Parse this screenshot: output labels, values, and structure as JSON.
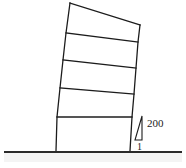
{
  "figure": {
    "background_color": "#ffffff",
    "line_color": "#1c1c1c",
    "ground_color": "#2b2b2b",
    "ground_shade_color": "#f4f4f4"
  },
  "building": {
    "name": "leaning-frame",
    "storeys": 5,
    "fill_color": "#ffffff",
    "outline": "70,3 140,25 130,151 56,151",
    "left_column_path": "M 70 3 L 66 33 L 63 60 L 60 88 L 57 117 L 56 151",
    "right_column_path": "M 140 25 L 138 42 L 136 68 L 134 94 L 132 117 L 130 151",
    "roof_line": "M 70 3 L 140 25",
    "base_line": "M 56 151 L 130 151",
    "floor_lines": [
      {
        "label": "floor-line-4",
        "d": "M 66 33 L 138 42"
      },
      {
        "label": "floor-line-3",
        "d": "M 63 60 L 136 68"
      },
      {
        "label": "floor-line-2",
        "d": "M 60 88 L 134 94"
      },
      {
        "label": "floor-line-1",
        "d": "M 57 117 L 132 117"
      }
    ]
  },
  "ground": {
    "name": "ground-line",
    "d": "M 4 152 L 182 152",
    "shade_rect": {
      "x": 4,
      "y": 153,
      "width": 178,
      "height": 9
    }
  },
  "slope_indicator": {
    "name": "slope-triangle",
    "triangle_points": "142,116 142,140 135,140",
    "rise_label": "200",
    "run_label": "1",
    "rise_label_x": 147,
    "rise_label_y": 127,
    "run_label_x": 137,
    "run_label_y": 150
  }
}
